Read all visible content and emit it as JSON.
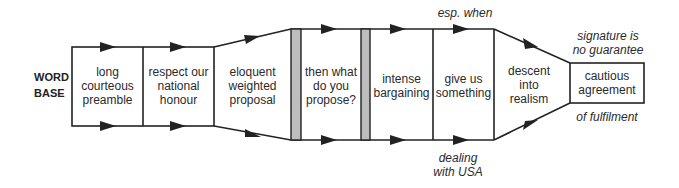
{
  "diagram": {
    "start_label": [
      "WORD",
      "BASE"
    ],
    "stages": [
      {
        "id": "long-courteous-preamble",
        "lines": [
          "long",
          "courteous",
          "preamble"
        ]
      },
      {
        "id": "respect-national-honour",
        "lines": [
          "respect our",
          "national",
          "honour"
        ]
      },
      {
        "id": "eloquent-weighted-proposal",
        "lines": [
          "eloquent",
          "weighted",
          "proposal"
        ]
      },
      {
        "id": "then-what-do-you-propose",
        "lines": [
          "then what",
          "do you",
          "propose?"
        ]
      },
      {
        "id": "intense-bargaining",
        "lines": [
          "intense",
          "bargaining"
        ]
      },
      {
        "id": "give-us-something",
        "lines": [
          "give us",
          "something"
        ]
      },
      {
        "id": "descent-into-realism",
        "lines": [
          "descent",
          "into",
          "realism"
        ]
      },
      {
        "id": "cautious-agreement",
        "lines": [
          "cautious",
          "agreement"
        ]
      }
    ],
    "annotations": {
      "esp_when": "esp. when",
      "dealing_with_usa": [
        "dealing",
        "with USA"
      ],
      "signature": [
        "signature is",
        "no guarantee"
      ],
      "fulfilment": "of fulfilment"
    },
    "colors": {
      "line": "#222222",
      "barrier_fill": "#bdbdbd",
      "background": "#ffffff"
    }
  }
}
